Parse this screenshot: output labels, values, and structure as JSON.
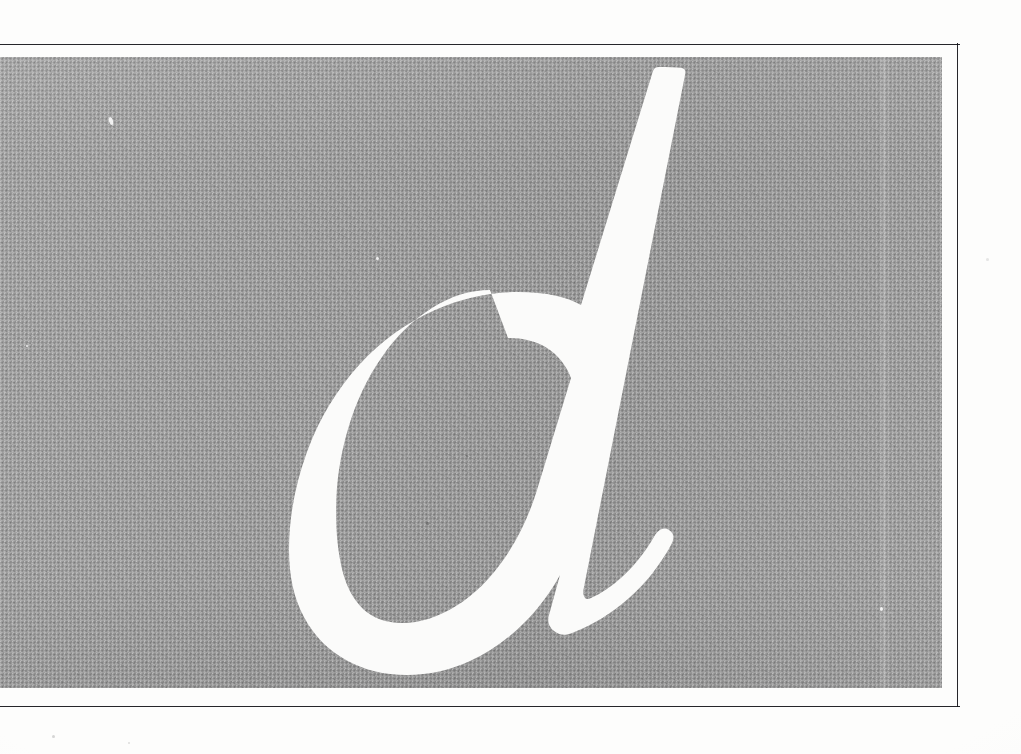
{
  "plate": {
    "name": "specimen-plate",
    "letter": "d",
    "letter_case": "lowercase",
    "letter_style": "italic-serif",
    "treatment": "reversed-out-white-on-gray",
    "caption": ""
  },
  "frame": {
    "name": "rule-frame",
    "top_rule_label": "",
    "bottom_rule_label": "",
    "right_rule_label": ""
  },
  "panel": {
    "name": "halftone-panel",
    "label": ""
  },
  "colors": {
    "paper": "#fdfdfc",
    "panel_gray": "#a2a2a2",
    "letter_white": "#fbfbfa",
    "rule_black": "#16161a"
  }
}
